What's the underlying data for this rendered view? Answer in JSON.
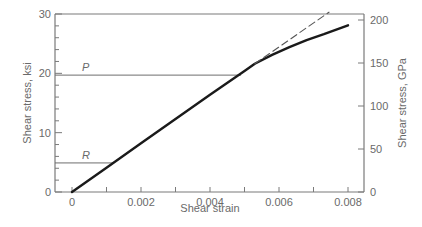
{
  "chart_data": {
    "type": "line",
    "title": "",
    "xlabel": "Shear strain",
    "ylabel": "Shear stress, ksi",
    "ylabel_right": "Shear stress, GPa",
    "xlim": [
      0,
      0.008
    ],
    "ylim": [
      0,
      30
    ],
    "ylim_right": [
      0,
      200
    ],
    "x_ticks": [
      0,
      0.001,
      0.002,
      0.003,
      0.004,
      0.005,
      0.006,
      0.007,
      0.008
    ],
    "x_tick_labels": [
      "0",
      "0.002",
      "0.004",
      "0.006",
      "0.008"
    ],
    "x_tick_label_values": [
      0,
      0.002,
      0.004,
      0.006,
      0.008
    ],
    "y_ticks": [
      0,
      2,
      4,
      6,
      8,
      10,
      12,
      14,
      16,
      18,
      20,
      22,
      24,
      26,
      28,
      30
    ],
    "y_tick_labels": [
      "0",
      "10",
      "20",
      "30"
    ],
    "y_tick_label_values": [
      0,
      10,
      20,
      30
    ],
    "y_right_ticks": [
      0,
      50,
      100,
      150,
      200
    ],
    "y_right_tick_labels": [
      "0",
      "50",
      "100",
      "150",
      "200"
    ],
    "grid": false,
    "series": [
      {
        "name": "stress-strain curve",
        "style": "solid",
        "x": [
          0,
          0.001,
          0.002,
          0.003,
          0.004,
          0.005,
          0.0053,
          0.0058,
          0.0063,
          0.0068,
          0.0073,
          0.008
        ],
        "y": [
          0,
          4.1,
          8.2,
          12.3,
          16.4,
          20.4,
          21.6,
          23.1,
          24.4,
          25.6,
          26.6,
          28.1
        ]
      },
      {
        "name": "linear extrapolation",
        "style": "dashed",
        "x": [
          0.0053,
          0.00745
        ],
        "y": [
          21.6,
          30.3
        ]
      }
    ],
    "reference_lines": [
      {
        "label": "P",
        "y": 19.7,
        "x_end": 0.0049
      },
      {
        "label": "R",
        "y": 4.9,
        "x_end": 0.0012
      }
    ],
    "legend": "none"
  }
}
